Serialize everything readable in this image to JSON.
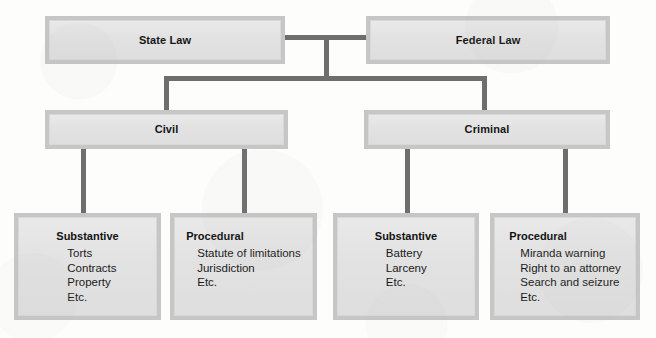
{
  "diagram": {
    "type": "hierarchy-tree",
    "levels": 3,
    "colors": {
      "box_fill": "#e3e3e3",
      "box_border": "#c6c6c6",
      "connector": "#6e6e6e",
      "text": "#161616",
      "background": "#fdfdfc"
    },
    "level1": [
      {
        "id": "state-law",
        "label": "State Law"
      },
      {
        "id": "federal-law",
        "label": "Federal Law"
      }
    ],
    "level2": [
      {
        "id": "civil",
        "label": "Civil"
      },
      {
        "id": "criminal",
        "label": "Criminal"
      }
    ],
    "level3": [
      {
        "id": "civil-substantive",
        "parent": "Civil",
        "heading": "Substantive",
        "items": [
          "Torts",
          "Contracts",
          "Property",
          "Etc."
        ]
      },
      {
        "id": "civil-procedural",
        "parent": "Civil",
        "heading": "Procedural",
        "items": [
          "Statute of limitations",
          "Jurisdiction",
          "Etc."
        ]
      },
      {
        "id": "criminal-substantive",
        "parent": "Criminal",
        "heading": "Substantive",
        "items": [
          "Battery",
          "Larceny",
          "Etc."
        ]
      },
      {
        "id": "criminal-procedural",
        "parent": "Criminal",
        "heading": "Procedural",
        "items": [
          "Miranda warning",
          "Right to an attorney",
          "Search and seizure",
          "Etc."
        ]
      }
    ]
  }
}
